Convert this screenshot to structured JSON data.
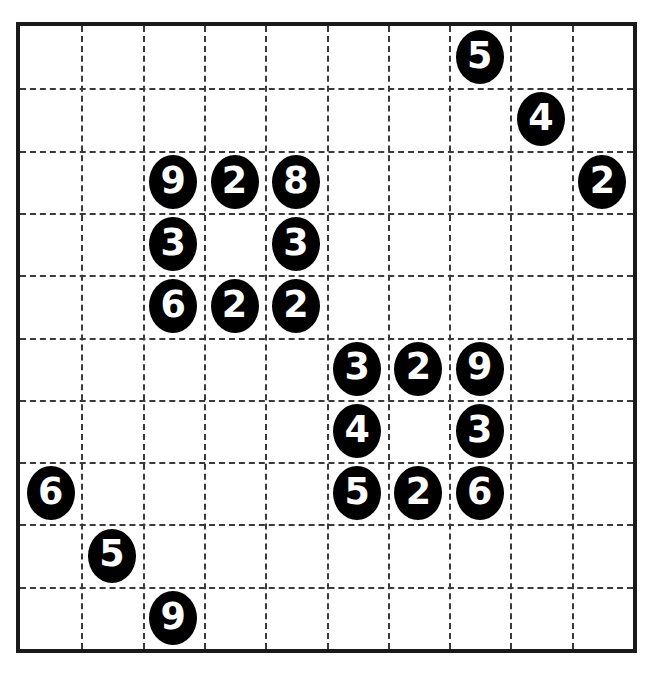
{
  "puzzle": {
    "title": "Number Grid Puzzle",
    "type": "number-placement-grid",
    "grid": {
      "rows": 10,
      "cols": 10,
      "cell_size_px": 62.1,
      "origin_x_px": 16,
      "origin_y_px": 22,
      "width_px": 621,
      "height_px": 631,
      "border_color": "#1a1a1a",
      "border_width_px": 4,
      "gridline_style": "dashed",
      "gridline_color": "#3a3a3a",
      "background_color": "#ffffff"
    },
    "token_style": {
      "shape": "circle",
      "fill_color": "#000000",
      "text_color": "#ffffff",
      "diameter_px": 48
    },
    "cells": [
      {
        "row": 0,
        "col": 7,
        "value": "5"
      },
      {
        "row": 1,
        "col": 8,
        "value": "4"
      },
      {
        "row": 2,
        "col": 2,
        "value": "9"
      },
      {
        "row": 2,
        "col": 3,
        "value": "2"
      },
      {
        "row": 2,
        "col": 4,
        "value": "8"
      },
      {
        "row": 2,
        "col": 9,
        "value": "2"
      },
      {
        "row": 3,
        "col": 2,
        "value": "3"
      },
      {
        "row": 3,
        "col": 4,
        "value": "3"
      },
      {
        "row": 4,
        "col": 2,
        "value": "6"
      },
      {
        "row": 4,
        "col": 3,
        "value": "2"
      },
      {
        "row": 4,
        "col": 4,
        "value": "2"
      },
      {
        "row": 5,
        "col": 5,
        "value": "3"
      },
      {
        "row": 5,
        "col": 6,
        "value": "2"
      },
      {
        "row": 5,
        "col": 7,
        "value": "9"
      },
      {
        "row": 6,
        "col": 5,
        "value": "4"
      },
      {
        "row": 6,
        "col": 7,
        "value": "3"
      },
      {
        "row": 7,
        "col": 0,
        "value": "6"
      },
      {
        "row": 7,
        "col": 5,
        "value": "5"
      },
      {
        "row": 7,
        "col": 6,
        "value": "2"
      },
      {
        "row": 7,
        "col": 7,
        "value": "6"
      },
      {
        "row": 8,
        "col": 1,
        "value": "5"
      },
      {
        "row": 9,
        "col": 2,
        "value": "9"
      }
    ]
  }
}
